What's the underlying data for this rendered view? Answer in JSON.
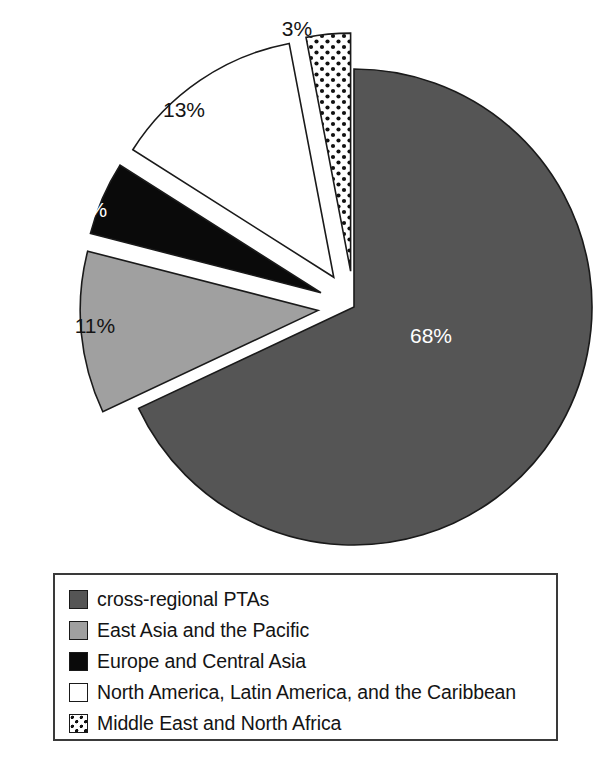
{
  "chart_data": {
    "type": "pie",
    "title": "",
    "subtitle": "",
    "xlabel": "",
    "ylabel": "",
    "grid": false,
    "legend_position": "bottom",
    "start_angle_deg": 0,
    "direction": "clockwise",
    "center": {
      "x": 354,
      "y": 307
    },
    "radius": 238,
    "categories": [
      "cross-regional PTAs",
      "East Asia and the Pacific",
      "Europe and Central Asia",
      "North America, Latin America, and the Caribbean",
      "Middle East and North Africa"
    ],
    "values": [
      68,
      11,
      5,
      13,
      3
    ],
    "value_labels": [
      "68%",
      "11%",
      "5%",
      "13%",
      "3%"
    ],
    "slices": [
      {
        "label": "cross-regional PTAs",
        "value": 68,
        "value_label": "68%",
        "fill": "#555555",
        "pattern": "solid",
        "label_color": "#ffffff",
        "exploded": false,
        "explode_distance": 0,
        "label_x": 431,
        "label_y": 337
      },
      {
        "label": "East Asia and the Pacific",
        "value": 11,
        "value_label": "11%",
        "fill": "#a0a0a0",
        "pattern": "solid",
        "label_color": "#141414",
        "exploded": true,
        "explode_distance": 36,
        "label_x": 95,
        "label_y": 327
      },
      {
        "label": "Europe and Central Asia",
        "value": 5,
        "value_label": "5%",
        "fill": "#0a0a0a",
        "pattern": "solid",
        "label_color": "#ffffff",
        "exploded": true,
        "explode_distance": 36,
        "label_x": 92,
        "label_y": 211
      },
      {
        "label": "North America, Latin America, and the Caribbean",
        "value": 13,
        "value_label": "13%",
        "fill": "#ffffff",
        "pattern": "solid",
        "label_color": "#141414",
        "exploded": true,
        "explode_distance": 36,
        "label_x": 184,
        "label_y": 111
      },
      {
        "label": "Middle East and North Africa",
        "value": 3,
        "value_label": "3%",
        "fill": "#ffffff",
        "pattern": "dots",
        "label_color": "#141414",
        "exploded": true,
        "explode_distance": 36,
        "label_x": 297,
        "label_y": 30
      }
    ]
  },
  "legend": {
    "items": [
      {
        "label": "cross-regional PTAs",
        "swatch_color": "#555555",
        "swatch_pattern": "solid"
      },
      {
        "label": "East Asia and the Pacific",
        "swatch_color": "#a0a0a0",
        "swatch_pattern": "solid"
      },
      {
        "label": "Europe and Central Asia",
        "swatch_color": "#0a0a0a",
        "swatch_pattern": "solid"
      },
      {
        "label": "North America, Latin America, and the Caribbean",
        "swatch_color": "#ffffff",
        "swatch_pattern": "solid"
      },
      {
        "label": "Middle East and North Africa",
        "swatch_color": "#ffffff",
        "swatch_pattern": "dots"
      }
    ]
  },
  "colors": {
    "cross_regional": "#555555",
    "east_asia": "#a0a0a0",
    "europe": "#0a0a0a",
    "americas": "#ffffff",
    "mena": "#ffffff",
    "outline": "#1a1a1a",
    "background": "#ffffff",
    "legend_border": "#3a3a3a"
  }
}
